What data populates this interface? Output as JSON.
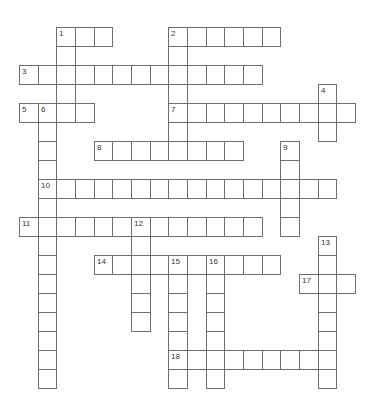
{
  "puzzle": {
    "type": "crossword",
    "layout": {
      "origin_x": 19,
      "origin_y": 27,
      "cell_width": 18.67,
      "cell_height": 19,
      "line_color": "#6e6e6e",
      "number_color": "#333333"
    },
    "words": [
      {
        "number": "1",
        "direction": "across",
        "row": 0,
        "col": 2,
        "length": 3
      },
      {
        "number": "1",
        "direction": "down",
        "row": 0,
        "col": 2,
        "length": 5
      },
      {
        "number": "2",
        "direction": "across",
        "row": 0,
        "col": 8,
        "length": 6
      },
      {
        "number": "2",
        "direction": "down",
        "row": 0,
        "col": 8,
        "length": 7
      },
      {
        "number": "3",
        "direction": "across",
        "row": 2,
        "col": 0,
        "length": 13
      },
      {
        "number": "4",
        "direction": "down",
        "row": 3,
        "col": 16,
        "length": 3
      },
      {
        "number": "5",
        "direction": "across",
        "row": 4,
        "col": 0,
        "length": 4
      },
      {
        "number": "6",
        "direction": "down",
        "row": 4,
        "col": 1,
        "length": 15
      },
      {
        "number": "7",
        "direction": "across",
        "row": 4,
        "col": 8,
        "length": 10
      },
      {
        "number": "8",
        "direction": "across",
        "row": 6,
        "col": 4,
        "length": 8
      },
      {
        "number": "9",
        "direction": "down",
        "row": 6,
        "col": 14,
        "length": 5
      },
      {
        "number": "10",
        "direction": "across",
        "row": 8,
        "col": 1,
        "length": 16
      },
      {
        "number": "11",
        "direction": "across",
        "row": 10,
        "col": 0,
        "length": 13
      },
      {
        "number": "12",
        "direction": "down",
        "row": 10,
        "col": 6,
        "length": 6
      },
      {
        "number": "13",
        "direction": "down",
        "row": 11,
        "col": 16,
        "length": 8
      },
      {
        "number": "14",
        "direction": "across",
        "row": 12,
        "col": 4,
        "length": 10
      },
      {
        "number": "15",
        "direction": "down",
        "row": 12,
        "col": 8,
        "length": 7
      },
      {
        "number": "16",
        "direction": "down",
        "row": 12,
        "col": 10,
        "length": 7
      },
      {
        "number": "17",
        "direction": "across",
        "row": 13,
        "col": 15,
        "length": 3
      },
      {
        "number": "18",
        "direction": "across",
        "row": 17,
        "col": 8,
        "length": 9
      }
    ]
  }
}
